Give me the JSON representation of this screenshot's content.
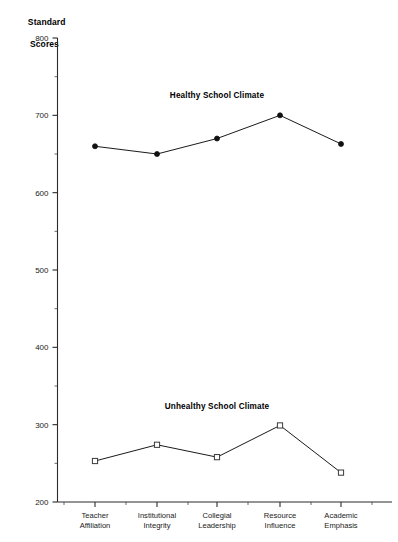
{
  "chart_data": {
    "type": "line",
    "title": "",
    "xlabel": "",
    "ylabel": "Standard Scores",
    "ylabel_line1": "Standard",
    "ylabel_line2": "Scores",
    "ylim": [
      200,
      800
    ],
    "ytick_step": 100,
    "yminor_step": 50,
    "grid": false,
    "legend_position": "inline-annotation",
    "categories": [
      "Teacher Affiliation",
      "Institutional Integrity",
      "Collegial Leadership",
      "Resource Influence",
      "Academic Emphasis"
    ],
    "category_lines": [
      [
        "Teacher",
        "Affiliation"
      ],
      [
        "Institutional",
        "Integrity"
      ],
      [
        "Collegial",
        "Leadership"
      ],
      [
        "Resource",
        "Influence"
      ],
      [
        "Academic",
        "Emphasis"
      ]
    ],
    "ytick_labels": [
      "800",
      "700",
      "600",
      "500",
      "400",
      "300",
      "200"
    ],
    "ytick_values": [
      800,
      700,
      600,
      500,
      400,
      300,
      200
    ],
    "series": [
      {
        "name": "Healthy School Climate",
        "marker": "filled-circle",
        "values": [
          660,
          650,
          670,
          700,
          663
        ],
        "annotation": "Healthy School Climate",
        "annotation_x_category_index": 2,
        "annotation_y": 723
      },
      {
        "name": "Unhealthy School Climate",
        "marker": "open-square",
        "values": [
          253,
          274,
          258,
          299,
          238
        ],
        "annotation": "Unhealthy School Climate",
        "annotation_x_category_index": 2,
        "annotation_y": 320
      }
    ]
  },
  "figure": {
    "axis_title_line1": "Standard",
    "axis_title_line2": "Scores",
    "healthy_label": "Healthy School Climate",
    "unhealthy_label": "Unhealthy School Climate",
    "caption_fragment": ""
  },
  "colors": {
    "background": "#ffffff",
    "axis": "#2b2b2b",
    "line": "#1a1a1a",
    "marker_filled": "#111111",
    "marker_open_stroke": "#3a3a3a",
    "text": "#111111"
  }
}
